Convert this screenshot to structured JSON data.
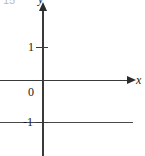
{
  "figure": {
    "caption_number": "15",
    "axis_labels": {
      "x": "x",
      "y": "y"
    },
    "tick_labels": {
      "origin": "0",
      "y_positive_one": "1",
      "y_negative_one": "-1"
    },
    "colors": {
      "axis": "#3a3a3a",
      "graph": "#4a4a4a",
      "background": "#ffffff",
      "figure_number": "#b9b9b9"
    }
  },
  "chart_data": {
    "type": "line",
    "title": "",
    "xlabel": "x",
    "ylabel": "y",
    "xlim": [
      -2.8,
      6.7
    ],
    "ylim": [
      -2.2,
      2.2
    ],
    "grid": false,
    "legend": null,
    "x_ticks": [],
    "y_ticks": [
      1,
      0,
      -1
    ],
    "y_tick_labels": [
      "1",
      "0",
      "-1"
    ],
    "series": [
      {
        "name": "y = -1",
        "x": [
          -2.8,
          6.1
        ],
        "values": [
          -1,
          -1
        ]
      }
    ],
    "annotations": [
      {
        "text": "15",
        "position": "top-left",
        "note": "figure number, clipped at top edge"
      }
    ]
  }
}
